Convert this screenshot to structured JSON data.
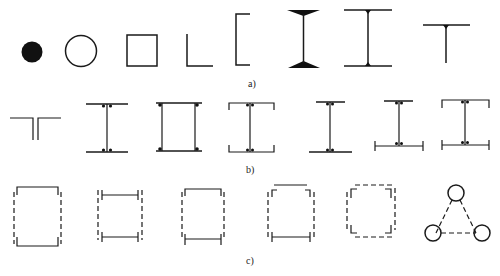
{
  "figure": {
    "rows": [
      {
        "label": "a)",
        "description": "Basic cross-section shapes",
        "items": [
          {
            "name": "solid-circle",
            "label": "solid round bar"
          },
          {
            "name": "hollow-circle",
            "label": "circular tube"
          },
          {
            "name": "square-tube",
            "label": "square hollow section"
          },
          {
            "name": "angle",
            "label": "angle (L-section)"
          },
          {
            "name": "channel",
            "label": "channel (C-section)"
          },
          {
            "name": "i-beam-tapered",
            "label": "I-beam with tapered flanges"
          },
          {
            "name": "i-beam-welded",
            "label": "welded I-beam"
          },
          {
            "name": "t-section",
            "label": "T-section"
          }
        ]
      },
      {
        "label": "b)",
        "description": "Built-up / welded sections",
        "items": [
          {
            "name": "double-angle-t",
            "label": "double-angle T"
          },
          {
            "name": "welded-i",
            "label": "welded I-section"
          },
          {
            "name": "welded-box",
            "label": "welded box section"
          },
          {
            "name": "channel-web-i",
            "label": "I-section with lipped flanges"
          },
          {
            "name": "unequal-i",
            "label": "I-section, wider bottom flange"
          },
          {
            "name": "i-bottom-lipped",
            "label": "I-section with lipped bottom flange"
          },
          {
            "name": "i-both-lipped",
            "label": "I-section with lipped flanges both sides"
          }
        ]
      },
      {
        "label": "c)",
        "description": "Laced / battened compound sections",
        "items": [
          {
            "name": "two-channels-laced",
            "label": "two channels laced"
          },
          {
            "name": "two-i-laced",
            "label": "two I-sections laced"
          },
          {
            "name": "channel-i-laced",
            "label": "channel and I-section laced"
          },
          {
            "name": "angles-mixed-laced",
            "label": "angles and plates laced"
          },
          {
            "name": "four-angles-laced",
            "label": "four angles laced"
          },
          {
            "name": "three-tube-triangle",
            "label": "three-tube triangular lattice"
          }
        ]
      }
    ]
  }
}
